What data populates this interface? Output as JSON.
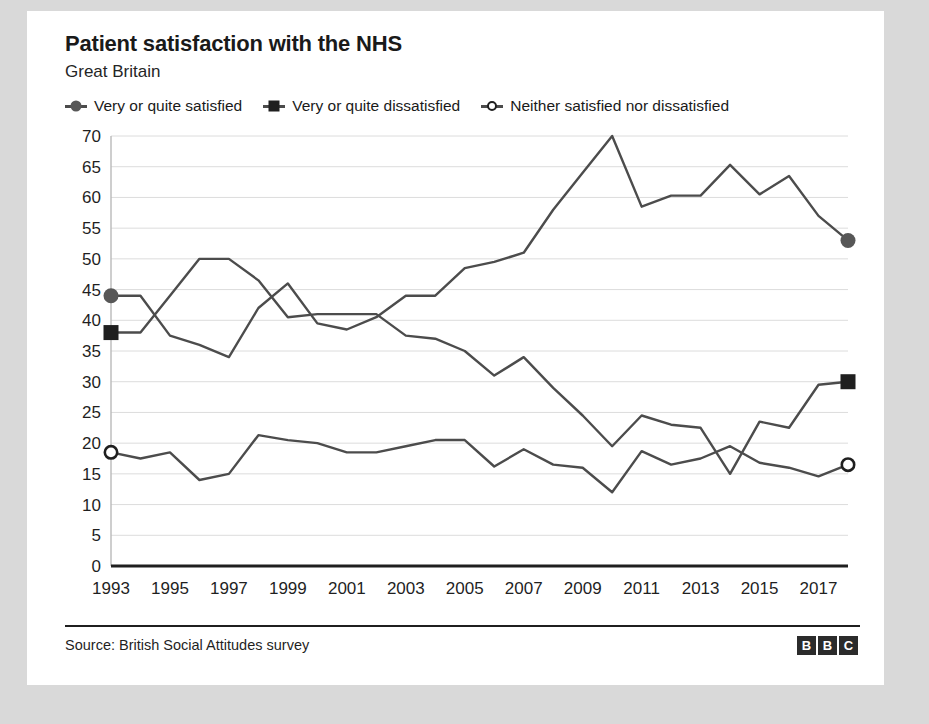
{
  "card": {
    "title": "Patient satisfaction with the NHS",
    "subtitle": "Great Britain",
    "source": "Source: British Social Attitudes survey",
    "logo": [
      "B",
      "B",
      "C"
    ]
  },
  "legend": [
    {
      "label": "Very or quite satisfied",
      "marker": "circle-filled",
      "color": "#575757"
    },
    {
      "label": "Very or quite dissatisfied",
      "marker": "square-filled",
      "color": "#1f1f1f"
    },
    {
      "label": "Neither satisfied nor dissatisfied",
      "marker": "circle-open",
      "color": "#1f1f1f"
    }
  ],
  "chart_data": {
    "type": "line",
    "title": "Patient satisfaction with the NHS",
    "subtitle": "Great Britain",
    "xlabel": "",
    "ylabel": "",
    "xlim": [
      1993,
      2018
    ],
    "ylim": [
      0,
      70
    ],
    "ytick_step": 5,
    "yticks": [
      0,
      5,
      10,
      15,
      20,
      25,
      30,
      35,
      40,
      45,
      50,
      55,
      60,
      65,
      70
    ],
    "xticks": [
      1993,
      1995,
      1997,
      1999,
      2001,
      2003,
      2005,
      2007,
      2009,
      2011,
      2013,
      2015,
      2017
    ],
    "x": [
      1993,
      1994,
      1995,
      1996,
      1997,
      1998,
      1999,
      2000,
      2001,
      2002,
      2003,
      2004,
      2005,
      2006,
      2007,
      2008,
      2009,
      2010,
      2011,
      2012,
      2013,
      2014,
      2015,
      2016,
      2017,
      2018
    ],
    "grid": "horizontal",
    "legend_position": "top",
    "line_color": "#4c4c4c",
    "axis_color": "#1f1f1f",
    "grid_color": "#dcdcdc",
    "series": [
      {
        "name": "Very or quite satisfied",
        "marker": "circle-filled",
        "endpoint_marker": true,
        "values": [
          44.0,
          44.0,
          37.5,
          36.0,
          34.0,
          42.0,
          46.0,
          39.5,
          38.5,
          40.5,
          44.0,
          44.0,
          48.5,
          49.5,
          51.0,
          58.0,
          64.0,
          70.0,
          58.5,
          60.3,
          60.3,
          65.3,
          60.5,
          63.5,
          57.0,
          53.0
        ]
      },
      {
        "name": "Very or quite dissatisfied",
        "marker": "square-filled",
        "endpoint_marker": true,
        "values": [
          38.0,
          38.0,
          44.0,
          50.0,
          50.0,
          46.5,
          40.5,
          41.0,
          41.0,
          41.0,
          37.5,
          37.0,
          35.0,
          31.0,
          34.0,
          29.0,
          24.5,
          19.5,
          24.5,
          23.0,
          22.5,
          15.0,
          23.5,
          22.5,
          29.5,
          30.0
        ]
      },
      {
        "name": "Neither satisfied nor dissatisfied",
        "marker": "circle-open",
        "endpoint_marker": true,
        "values": [
          18.5,
          17.5,
          18.5,
          14.0,
          15.0,
          21.3,
          20.5,
          20.0,
          18.5,
          18.5,
          19.5,
          20.5,
          20.5,
          16.2,
          19.0,
          16.5,
          16.0,
          12.0,
          18.7,
          16.5,
          17.5,
          19.5,
          16.8,
          16.0,
          14.6,
          16.5
        ]
      }
    ]
  }
}
